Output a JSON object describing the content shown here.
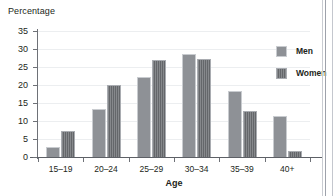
{
  "chart_data": {
    "type": "bar",
    "title": "",
    "ylabel": "Percentage",
    "xlabel": "Age",
    "categories": [
      "15–19",
      "20–24",
      "25–29",
      "30–34",
      "35–39",
      "40+"
    ],
    "series": [
      {
        "name": "Men",
        "color": "#8e9196",
        "values": [
          2.8,
          13.2,
          22.3,
          28.6,
          18.4,
          11.3
        ]
      },
      {
        "name": "Women",
        "color": "#6f7276",
        "values": [
          7.1,
          19.9,
          26.9,
          27.1,
          12.7,
          1.6
        ]
      }
    ],
    "ylim": [
      0,
      35
    ],
    "yticks": [
      0,
      5,
      10,
      15,
      20,
      25,
      30,
      35
    ],
    "ytick_labels": [
      "0",
      "5",
      "10",
      "15",
      "20",
      "25",
      "30",
      "35"
    ],
    "grid": true,
    "grid_axis": "y",
    "legend_position": "top-right",
    "legend_entries": [
      "Men",
      "Women"
    ]
  },
  "legend": {
    "men_label": "Men",
    "women_label": "Women"
  },
  "axes": {
    "y_title": "Percentage",
    "x_title": "Age"
  }
}
